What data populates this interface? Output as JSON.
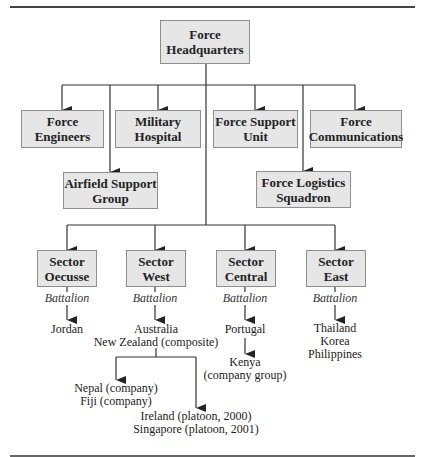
{
  "diagram": {
    "type": "org-chart",
    "root": {
      "label": "Force\nHeadquarters"
    },
    "force_units": [
      {
        "id": "engineers",
        "label": "Force\nEngineers"
      },
      {
        "id": "hospital",
        "label": "Military\nHospital"
      },
      {
        "id": "support",
        "label": "Force Support\nUnit"
      },
      {
        "id": "communications",
        "label": "Force\nCommunications"
      },
      {
        "id": "airfield",
        "label": "Airfield Support\nGroup"
      },
      {
        "id": "logistics",
        "label": "Force Logistics\nSquadron"
      }
    ],
    "sectors": [
      {
        "label": "Sector\nOecusse",
        "sublabel": "Battalion",
        "contributors": "Jordan"
      },
      {
        "label": "Sector\nWest",
        "sublabel": "Battalion",
        "contributors": "Australia\nNew Zealand (composite)",
        "sub_left": "Nepal (company)\nFiji (company)",
        "sub_right": "Ireland (platoon, 2000)\nSingapore (platoon, 2001)"
      },
      {
        "label": "Sector\nCentral",
        "sublabel": "Battalion",
        "contributors": "Portugal",
        "sub": "Kenya\n(company group)"
      },
      {
        "label": "Sector\nEast",
        "sublabel": "Battalion",
        "contributors": "Thailand\nKorea\nPhilippines"
      }
    ],
    "colors": {
      "box_fill": "#e6e6e6",
      "box_border": "#8f8f8f",
      "line": "#333333"
    }
  }
}
